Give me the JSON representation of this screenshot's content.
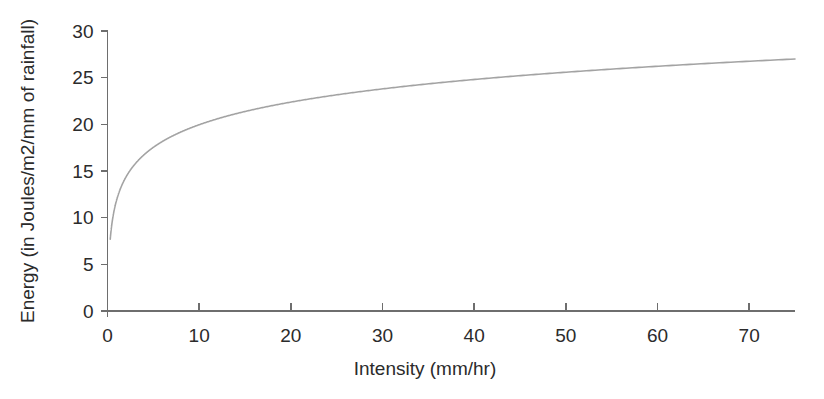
{
  "chart_data": {
    "type": "line",
    "title": "",
    "xlabel": "Intensity (mm/hr)",
    "ylabel": "Energy (in Joules/m2/mm of rainfall)",
    "xlim": [
      0,
      75
    ],
    "ylim": [
      0,
      30
    ],
    "xticks": [
      0,
      10,
      20,
      30,
      40,
      50,
      60,
      70
    ],
    "xtick_labels": [
      "0",
      "10",
      "20",
      "30",
      "40",
      "50",
      "60",
      "70"
    ],
    "yticks": [
      0,
      5,
      10,
      15,
      20,
      25,
      30
    ],
    "ytick_labels": [
      "0",
      "5",
      "10",
      "15",
      "20",
      "25",
      "30"
    ],
    "grid": false,
    "legend": false,
    "legend_position": "none",
    "series": [
      {
        "name": "Kinetic energy of rainfall",
        "color": "#a3a3a3",
        "relationship": "E = 11.9 + 3.5 * ln(I)",
        "x": [
          0.3,
          0.5,
          0.8,
          1,
          1.5,
          2,
          3,
          4,
          5,
          6,
          8,
          10,
          12,
          15,
          18,
          20,
          25,
          30,
          35,
          40,
          45,
          50,
          55,
          60,
          65,
          70,
          75
        ],
        "y": [
          7.7,
          9.5,
          11.1,
          11.9,
          13.3,
          14.3,
          15.7,
          16.7,
          17.5,
          18.2,
          19.2,
          20.0,
          20.6,
          21.4,
          22.0,
          22.4,
          23.2,
          23.8,
          24.4,
          24.8,
          25.2,
          25.6,
          25.9,
          26.2,
          26.5,
          26.8,
          27.0
        ],
        "endpoint_value": 28.2
      }
    ]
  },
  "axes": {
    "x_axis_name": "intensity-axis",
    "y_axis_name": "energy-axis"
  }
}
